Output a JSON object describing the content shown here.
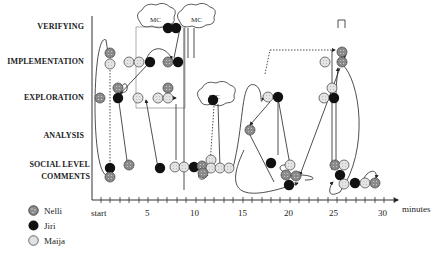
{
  "y_axis": {
    "categories": [
      {
        "key": "verifying",
        "label": "VERIFYING",
        "y": 27
      },
      {
        "key": "implementation",
        "label": "IMPLEMENTATION",
        "y": 62
      },
      {
        "key": "exploration",
        "label": "EXPLORATION",
        "y": 98
      },
      {
        "key": "analysis",
        "label": "ANALYSIS",
        "y": 137
      },
      {
        "key": "social_line1",
        "label": "SOCIAL LEVEL",
        "y": 165
      },
      {
        "key": "social_line2",
        "label": "COMMENTS",
        "y": 177
      }
    ]
  },
  "x_axis": {
    "unit_label": "minutes",
    "ticks": [
      {
        "label": "start",
        "x": 96
      },
      {
        "label": "5",
        "x": 148
      },
      {
        "label": "10",
        "x": 195
      },
      {
        "label": "15",
        "x": 242
      },
      {
        "label": "20",
        "x": 287
      },
      {
        "label": "25",
        "x": 332
      },
      {
        "label": "30",
        "x": 383
      }
    ]
  },
  "legend": [
    {
      "name": "Nelli",
      "style": "dotted-dark",
      "color": "#8a8a8a"
    },
    {
      "name": "Jiri",
      "style": "solid-black",
      "color": "#111111"
    },
    {
      "name": "Maija",
      "style": "dotted-light",
      "color": "#d8d8d8"
    }
  ],
  "annotations": {
    "cloud_label": "MC"
  },
  "colors": {
    "nelli": "#8a8a8a",
    "jiri": "#111111",
    "maija": "#dcdcdc",
    "line": "#222222"
  }
}
